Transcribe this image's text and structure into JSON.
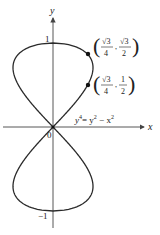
{
  "figure": {
    "equation": {
      "lhs_base": "y",
      "lhs_exp": "4",
      "rhs": "= y",
      "rhs_exp1": "2",
      "rhs_mid": " − x",
      "rhs_exp2": "2"
    },
    "axes": {
      "x_label": "x",
      "y_label": "y",
      "origin_label": "0",
      "y_tick_top": "1",
      "y_tick_bottom": "−1"
    },
    "points": [
      {
        "x_num": "√3",
        "x_den": "4",
        "y_num": "√3",
        "y_den": "2"
      },
      {
        "x_num": "√3",
        "x_den": "4",
        "y_num": "1",
        "y_den": "2"
      }
    ],
    "colors": {
      "curve": "#2a2a2a",
      "axis": "#444444",
      "point": "#111111"
    }
  }
}
